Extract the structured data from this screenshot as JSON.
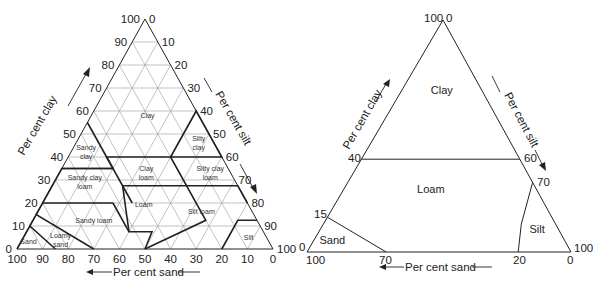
{
  "left_diagram": {
    "name": "USDA soil texture triangle (detailed)",
    "vertices": {
      "apex": [
        145,
        19
      ],
      "left": [
        17,
        249
      ],
      "right": [
        273,
        249
      ]
    },
    "axis_labels": {
      "clay": "Per cent clay",
      "silt": "Per cent silt",
      "sand": "Per cent sand"
    },
    "ticks": [
      0,
      10,
      20,
      30,
      40,
      50,
      60,
      70,
      80,
      90,
      100
    ],
    "classes": [
      {
        "label": [
          "Clay"
        ],
        "clay": 58,
        "sand": 20,
        "size": "s"
      },
      {
        "label": [
          "Sandy",
          "clay"
        ],
        "clay": 42,
        "sand": 52,
        "size": "s"
      },
      {
        "label": [
          "Silty",
          "clay"
        ],
        "clay": 46,
        "sand": 6,
        "size": "s"
      },
      {
        "label": [
          "Clay",
          "loam"
        ],
        "clay": 33,
        "sand": 33,
        "size": "s"
      },
      {
        "label": [
          "Silty clay",
          "loam"
        ],
        "clay": 33,
        "sand": 8,
        "size": "s"
      },
      {
        "label": [
          "Sandy clay",
          "loam"
        ],
        "clay": 29,
        "sand": 59,
        "size": "s"
      },
      {
        "label": [
          "Loam"
        ],
        "clay": 19,
        "sand": 41,
        "size": "s"
      },
      {
        "label": [
          "Silt loam"
        ],
        "clay": 16,
        "sand": 20,
        "size": "s"
      },
      {
        "label": [
          "Sandy loam"
        ],
        "clay": 12,
        "sand": 64,
        "size": "s"
      },
      {
        "label": [
          "Loamy",
          "sand"
        ],
        "clay": 4,
        "sand": 81,
        "size": "s"
      },
      {
        "label": [
          "Sand"
        ],
        "clay": 3,
        "sand": 94,
        "size": "s"
      },
      {
        "label": [
          "Silt"
        ],
        "clay": 5,
        "sand": 7,
        "size": "s"
      }
    ],
    "boundaries": [
      [
        [
          0,
          100
        ],
        [
          10,
          90
        ],
        [
          0,
          85
        ]
      ],
      [
        [
          10,
          90
        ],
        [
          15,
          85
        ],
        [
          0,
          70
        ]
      ],
      [
        [
          15,
          85
        ],
        [
          20,
          80
        ],
        [
          20,
          52.5
        ]
      ],
      [
        [
          20,
          45
        ],
        [
          35,
          45
        ],
        [
          35,
          65
        ],
        [
          20,
          80
        ]
      ],
      [
        [
          55,
          45
        ],
        [
          35,
          45
        ]
      ],
      [
        [
          35,
          65
        ],
        [
          35,
          45
        ],
        [
          40,
          45
        ],
        [
          40,
          20
        ],
        [
          27.5,
          20
        ],
        [
          27.5,
          45
        ]
      ],
      [
        [
          40,
          20
        ],
        [
          60,
          0
        ],
        [
          40,
          0
        ],
        [
          40,
          20
        ]
      ],
      [
        [
          27.5,
          45
        ],
        [
          7.5,
          52.5
        ],
        [
          7.5,
          43.5
        ],
        [
          0,
          50
        ]
      ],
      [
        [
          27.5,
          20
        ],
        [
          27.5,
          0
        ],
        [
          20,
          0
        ]
      ],
      [
        [
          20,
          52.5
        ],
        [
          7.5,
          52.5
        ]
      ],
      [
        [
          12.5,
          0
        ],
        [
          12.5,
          7.5
        ],
        [
          0,
          20
        ]
      ],
      [
        [
          27.5,
          20
        ],
        [
          12.5,
          20
        ],
        [
          0,
          50
        ]
      ]
    ]
  },
  "right_diagram": {
    "name": "Simplified soil texture triangle",
    "vertices": {
      "apex": [
        443,
        20
      ],
      "left": [
        307,
        252
      ],
      "right": [
        571,
        252
      ]
    },
    "axis_labels": {
      "clay": "Per cent clay",
      "silt": "Per cent silt",
      "sand": "Per cent sand"
    },
    "tick_labels": {
      "apex_left": "100",
      "apex_right": "0",
      "clay_40": "40",
      "clay_15": "15",
      "clay_0": "0",
      "silt_60": "60",
      "silt_70": "70",
      "silt_100": "100",
      "sand_100": "100",
      "sand_70": "70",
      "sand_20": "20",
      "sand_0": "0"
    },
    "classes": [
      {
        "label": "Clay",
        "clay": 70,
        "sand": 15
      },
      {
        "label": "Loam",
        "clay": 27,
        "sand": 40
      },
      {
        "label": "Sand",
        "clay": 5,
        "sand": 88
      },
      {
        "label": "Silt",
        "clay": 10,
        "sand": 8
      }
    ],
    "boundaries": [
      [
        [
          40,
          60
        ],
        [
          40,
          0
        ]
      ],
      [
        [
          15,
          85
        ],
        [
          0,
          70
        ]
      ],
      [
        [
          30,
          0
        ],
        [
          12,
          13
        ],
        [
          0,
          20
        ]
      ]
    ]
  }
}
